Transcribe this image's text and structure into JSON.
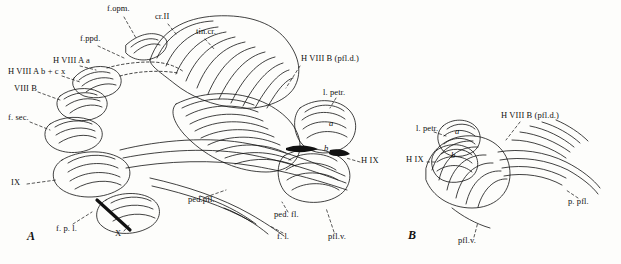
{
  "figure": {
    "panels": [
      {
        "id": "A",
        "label": "A"
      },
      {
        "id": "B",
        "label": "B"
      }
    ]
  },
  "labels_panel_a": [
    {
      "id": "f-opm",
      "text": "f.opm.",
      "x": 107,
      "y": 8
    },
    {
      "id": "cr-ii",
      "text": "cr.II",
      "x": 155,
      "y": 16
    },
    {
      "id": "tin-cr",
      "text": "tin.cr.",
      "x": 196,
      "y": 31
    },
    {
      "id": "f-ppd",
      "text": "f.ppd.",
      "x": 80,
      "y": 38
    },
    {
      "id": "h-viii-a",
      "text": "H VIII A a",
      "x": 53,
      "y": 60
    },
    {
      "id": "h-viii-ab",
      "text": "H VIII A b + c x",
      "x": 10,
      "y": 71
    },
    {
      "id": "viii-b",
      "text": "VIII B",
      "x": 14,
      "y": 88
    },
    {
      "id": "f-sec",
      "text": "f. sec.",
      "x": 10,
      "y": 117
    },
    {
      "id": "ix-a",
      "text": "IX",
      "x": 12,
      "y": 182
    },
    {
      "id": "f-p-l",
      "text": "f. p. l.",
      "x": 58,
      "y": 228
    },
    {
      "id": "x-a",
      "text": "X",
      "x": 116,
      "y": 233
    },
    {
      "id": "ped-pfl",
      "text": "ped.pfl.",
      "x": 190,
      "y": 199
    },
    {
      "id": "f-l",
      "text": "f. l.",
      "x": 278,
      "y": 236
    },
    {
      "id": "ped-fl",
      "text": "ped. fl.",
      "x": 276,
      "y": 214
    },
    {
      "id": "pfl-v-a",
      "text": "pfl.v.",
      "x": 330,
      "y": 236
    },
    {
      "id": "h-viii-bpfl",
      "text": "H VIII B (pfl.d.)",
      "x": 303,
      "y": 58
    },
    {
      "id": "l-petr-a",
      "text": "l. petr.",
      "x": 324,
      "y": 92
    },
    {
      "id": "h-ix-a",
      "text": "H IX",
      "x": 363,
      "y": 160
    },
    {
      "id": "a-cap",
      "text": "a",
      "x": 330,
      "y": 123
    },
    {
      "id": "b-cap",
      "text": "b",
      "x": 325,
      "y": 148
    },
    {
      "id": "panel-a",
      "text": "A",
      "x": 28,
      "y": 237
    }
  ],
  "labels_panel_b": [
    {
      "id": "l-petr-b",
      "text": "l. petr.",
      "x": 418,
      "y": 128
    },
    {
      "id": "h-viii-b-b",
      "text": "H VIII B (pfl.d.)",
      "x": 503,
      "y": 115
    },
    {
      "id": "h-ix-b",
      "text": "H IX",
      "x": 408,
      "y": 159
    },
    {
      "id": "a-b",
      "text": "a",
      "x": 456,
      "y": 131
    },
    {
      "id": "b-b",
      "text": "b",
      "x": 452,
      "y": 155
    },
    {
      "id": "p-pfl",
      "text": "p. pfl.",
      "x": 570,
      "y": 201
    },
    {
      "id": "pfl-v-b",
      "text": "pfl.v.",
      "x": 460,
      "y": 240
    },
    {
      "id": "panel-b",
      "text": "B",
      "x": 409,
      "y": 236
    }
  ],
  "colors": {
    "ink": "#111111",
    "paper": "#fdfdfb"
  }
}
